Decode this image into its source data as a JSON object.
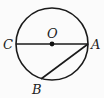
{
  "diagram": {
    "type": "circle-geometry",
    "circle": {
      "center": "O",
      "cx": 52,
      "cy": 44,
      "r": 36
    },
    "points": {
      "O": {
        "label": "O",
        "x": 52,
        "y": 44,
        "label_x": 47,
        "label_y": 38
      },
      "C": {
        "label": "C",
        "x": 16,
        "y": 44,
        "label_x": 3,
        "label_y": 49
      },
      "A": {
        "label": "A",
        "x": 88,
        "y": 44,
        "label_x": 91,
        "label_y": 49
      },
      "B": {
        "label": "B",
        "x": 41,
        "y": 79,
        "label_x": 32,
        "label_y": 94
      }
    },
    "segments": [
      {
        "name": "diameter-CA",
        "from": "C",
        "to": "A"
      },
      {
        "name": "chord-AB",
        "from": "A",
        "to": "B"
      }
    ],
    "colors": {
      "stroke": "#1a1a1a",
      "background": "#fbfbfb"
    }
  }
}
